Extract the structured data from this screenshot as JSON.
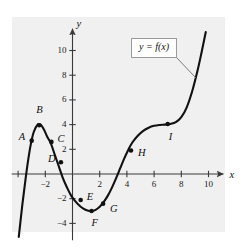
{
  "figure": {
    "title": "",
    "panel_color": "#f0f0f0",
    "curve_color": "#111111",
    "axis_color": "#3a3a3a"
  },
  "axes": {
    "x_name": "x",
    "y_name": "y",
    "x_ticks": [
      {
        "value": -4,
        "label": ""
      },
      {
        "value": -2,
        "label": "−2"
      },
      {
        "value": 2,
        "label": "2"
      },
      {
        "value": 4,
        "label": "4"
      },
      {
        "value": 6,
        "label": "6"
      },
      {
        "value": 8,
        "label": "8"
      },
      {
        "value": 10,
        "label": "10"
      }
    ],
    "y_ticks": [
      {
        "value": 10,
        "label": "10"
      },
      {
        "value": 8,
        "label": "8"
      },
      {
        "value": 6,
        "label": "6"
      },
      {
        "value": 4,
        "label": "4"
      },
      {
        "value": 2,
        "label": "2"
      },
      {
        "value": -2,
        "label": "−2"
      },
      {
        "value": -4,
        "label": "−4"
      }
    ]
  },
  "callout": {
    "text": "y = f(x)"
  },
  "chart_data": {
    "type": "line",
    "title": "",
    "xlabel": "x",
    "ylabel": "y",
    "xlim": [
      -4.4,
      10.8
    ],
    "ylim": [
      -5.2,
      11.6
    ],
    "grid": false,
    "legend": "none",
    "series": [
      {
        "name": "y = f(x)",
        "x": [
          -3.95,
          -3.7,
          -3.45,
          -3.25,
          -3.05,
          -2.85,
          -2.6,
          -2.35,
          -2.1,
          -1.85,
          -1.6,
          -1.3,
          -1.0,
          -0.7,
          -0.4,
          -0.1,
          0.2,
          0.5,
          0.8,
          1.1,
          1.4,
          1.7,
          2.0,
          2.3,
          2.6,
          2.9,
          3.2,
          3.5,
          3.8,
          4.1,
          4.4,
          4.8,
          5.2,
          5.6,
          6.0,
          6.4,
          6.8,
          7.2,
          7.6,
          8.0,
          8.4,
          8.8,
          9.2,
          9.5,
          9.8
        ],
        "y": [
          -5.1,
          -2.6,
          -0.4,
          1.2,
          2.5,
          3.4,
          3.95,
          4.0,
          3.6,
          3.0,
          2.5,
          1.55,
          0.6,
          -0.35,
          -1.1,
          -1.75,
          -2.2,
          -2.55,
          -2.8,
          -2.95,
          -3.0,
          -2.9,
          -2.65,
          -2.25,
          -1.75,
          -1.1,
          -0.35,
          0.45,
          1.25,
          1.95,
          2.55,
          3.1,
          3.5,
          3.75,
          3.9,
          3.97,
          4.0,
          4.05,
          4.2,
          4.6,
          5.4,
          6.7,
          8.4,
          9.9,
          11.5
        ]
      }
    ],
    "labeled_points": [
      {
        "id": "A",
        "x": -3.0,
        "y": 2.7,
        "label_dx": -13,
        "label_dy": -4
      },
      {
        "id": "B",
        "x": -2.45,
        "y": 3.95,
        "label_dx": -3,
        "label_dy": -15
      },
      {
        "id": "C",
        "x": -1.55,
        "y": 2.6,
        "label_dx": 6,
        "label_dy": -3
      },
      {
        "id": "D",
        "x": -0.85,
        "y": 0.95,
        "label_dx": -13,
        "label_dy": -3
      },
      {
        "id": "E",
        "x": 0.6,
        "y": -2.1,
        "label_dx": 6,
        "label_dy": -3
      },
      {
        "id": "F",
        "x": 1.4,
        "y": -3.0,
        "label_dx": 0,
        "label_dy": 12
      },
      {
        "id": "G",
        "x": 2.25,
        "y": -2.4,
        "label_dx": 7,
        "label_dy": 5
      },
      {
        "id": "H",
        "x": 4.3,
        "y": 1.9,
        "label_dx": 7,
        "label_dy": 2
      },
      {
        "id": "I",
        "x": 7.0,
        "y": 4.05,
        "label_dx": 1,
        "label_dy": 13
      }
    ]
  }
}
